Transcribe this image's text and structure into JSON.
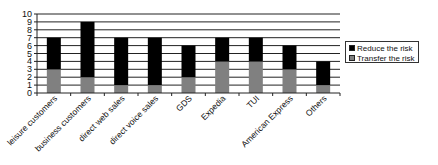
{
  "chart_data": {
    "type": "bar",
    "stacked": true,
    "title": "",
    "xlabel": "",
    "ylabel": "",
    "ylim": [
      0,
      10
    ],
    "yticks": [
      0,
      1,
      2,
      3,
      4,
      5,
      6,
      7,
      8,
      9,
      10
    ],
    "grid": true,
    "legend_position": "right",
    "categories": [
      "leisure customers",
      "business customers",
      "direct web sales",
      "direct voice sales",
      "GDS",
      "Expedia",
      "TUI",
      "American Express",
      "Others"
    ],
    "series": [
      {
        "name": "Transfer the risk",
        "color": "#808080",
        "values": [
          3,
          2,
          1,
          1,
          2,
          4,
          4,
          3,
          1
        ]
      },
      {
        "name": "Reduce the risk",
        "color": "#000000",
        "values": [
          4,
          7,
          6,
          6,
          4,
          3,
          3,
          3,
          3
        ]
      }
    ]
  },
  "legend": {
    "items": [
      {
        "label": "Reduce the risk",
        "color": "#000000"
      },
      {
        "label": "Transfer the risk",
        "color": "#808080"
      }
    ]
  }
}
